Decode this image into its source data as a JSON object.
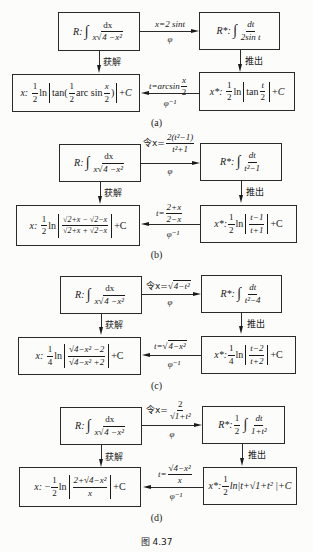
{
  "figure_caption": "图   4.37",
  "panels": [
    {
      "id": "a",
      "caption": "(a)",
      "R": {
        "label": "R:",
        "num": "dx",
        "den_x": "x",
        "den_rad": "4 −x²"
      },
      "Rstar": {
        "label": "R*:",
        "num": "dt",
        "den": "2sin t"
      },
      "forward": {
        "top": "x=2 sint",
        "bottom": "φ"
      },
      "down_left": "获解",
      "down_right": "推出",
      "back": {
        "top_left": "t=arcsin",
        "top_num": "x",
        "top_den": "2",
        "bottom": "φ⁻¹"
      },
      "x": {
        "label": "x:",
        "expr": "½ ln|tan(½ arc sin x/2)| +C"
      },
      "xstar": {
        "label": "x*:",
        "expr": "½ ln|tan t/2| +C"
      }
    },
    {
      "id": "b",
      "caption": "(b)",
      "R": {
        "label": "R:",
        "num": "dx",
        "den_x": "x",
        "den_rad": "4 −x²"
      },
      "Rstar": {
        "label": "R*:",
        "num": "dt",
        "den": "t²−1"
      },
      "forward": {
        "top_prefix": "令x=",
        "top_num": "2(t²−1)",
        "top_den": "t²+1",
        "bottom": "φ"
      },
      "down_left": "获解",
      "down_right": "推出",
      "back": {
        "top_left": "t=",
        "top_num": "2+x",
        "top_den": "2−x",
        "bottom": "φ⁻¹"
      },
      "x": {
        "label": "x:",
        "coef_num": "1",
        "coef_den": "2",
        "ln": "ln",
        "num": "√2+x − √2−x",
        "den": "√2+x + √2−x",
        "tail": "+C"
      },
      "xstar": {
        "label": "x*:",
        "coef_num": "1",
        "coef_den": "2",
        "ln": "ln",
        "num": "t−1",
        "den": "t+1",
        "tail": "+C"
      }
    },
    {
      "id": "c",
      "caption": "(c)",
      "R": {
        "label": "R:",
        "num": "dx",
        "den_x": "x",
        "den_rad": "4 −x²"
      },
      "Rstar": {
        "label": "R*:",
        "num": "dt",
        "den": "t²−4"
      },
      "forward": {
        "top_prefix": "令x=",
        "top_rad": "4−t²",
        "bottom": "φ"
      },
      "down_left": "获解",
      "down_right": "推出",
      "back": {
        "top_left": "t=",
        "top_rad": "4−x²",
        "bottom": "φ⁻¹"
      },
      "x": {
        "label": "x:",
        "coef_num": "1",
        "coef_den": "4",
        "ln": "ln",
        "num": "√4−x² −2",
        "den": "√4−x² +2",
        "tail": "+C"
      },
      "xstar": {
        "label": "x*:",
        "coef_num": "1",
        "coef_den": "4",
        "ln": "ln",
        "num": "t−2",
        "den": "t+2",
        "tail": "+C"
      }
    },
    {
      "id": "d",
      "caption": "(d)",
      "R": {
        "label": "R:",
        "num": "dx",
        "den_x": "x",
        "den_rad": "4 −x²"
      },
      "Rstar": {
        "label": "R*:",
        "coef_num": "1",
        "coef_den": "2",
        "num": "dt",
        "den": "1+t²"
      },
      "forward": {
        "top_prefix": "令x=",
        "top_num": "2",
        "top_den": "√1+t²",
        "bottom": "φ"
      },
      "down_left": "获解",
      "down_right": "推出",
      "back": {
        "top_left": "t=",
        "top_num": "√4−x²",
        "top_den": "x",
        "bottom": "φ⁻¹"
      },
      "x": {
        "label": "x:",
        "sign": "−",
        "coef_num": "1",
        "coef_den": "2",
        "ln": "ln",
        "num": "2+√4−x²",
        "den": "x",
        "tail": "+C"
      },
      "xstar": {
        "label": "x*:",
        "coef_num": "1",
        "coef_den": "2",
        "expr": "ln|t+√1+t² |+C"
      }
    }
  ]
}
